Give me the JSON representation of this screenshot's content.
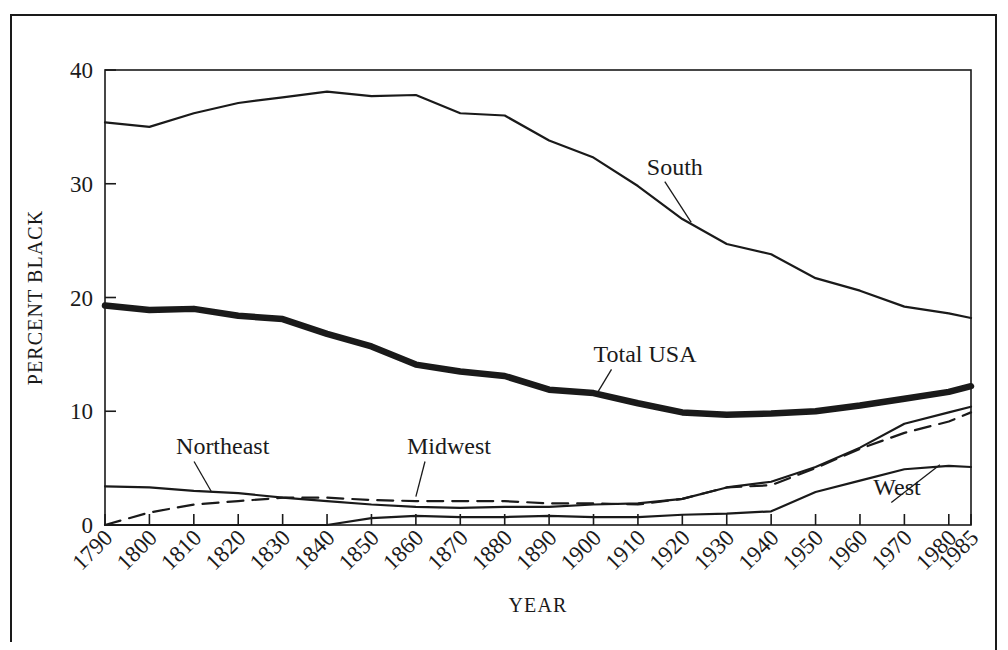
{
  "figure": {
    "kind": "line-chart",
    "background_color": "#ffffff",
    "ink_color": "#1a1a1a",
    "border": "thin rectangular rule around entire figure"
  },
  "chart_data": {
    "type": "line",
    "title": "",
    "subtitle": "",
    "xlabel": "YEAR",
    "ylabel": "PERCENT BLACK",
    "xlim": [
      1790,
      1985
    ],
    "ylim": [
      0,
      40
    ],
    "ytick_values": [
      0,
      10,
      20,
      30,
      40
    ],
    "ytick_labels": [
      "0",
      "10",
      "20",
      "30",
      "40"
    ],
    "x": [
      1790,
      1800,
      1810,
      1820,
      1830,
      1840,
      1850,
      1860,
      1870,
      1880,
      1890,
      1900,
      1910,
      1920,
      1930,
      1940,
      1950,
      1960,
      1970,
      1980,
      1985
    ],
    "xtick_labels": [
      "1790",
      "1800",
      "1810",
      "1820",
      "1830",
      "1840",
      "1850",
      "1860",
      "1870",
      "1880",
      "1890",
      "1900",
      "1910",
      "1920",
      "1930",
      "1940",
      "1950",
      "1960",
      "1970",
      "1980",
      "1985"
    ],
    "xtick_rotation_deg": 45,
    "grid": false,
    "legend": "inline labels with leader lines",
    "series": [
      {
        "name": "South",
        "style": "thin solid",
        "values": [
          35.4,
          35.0,
          36.2,
          37.1,
          37.6,
          38.1,
          37.7,
          37.8,
          36.2,
          36.0,
          33.8,
          32.3,
          29.8,
          26.9,
          24.7,
          23.8,
          21.7,
          20.6,
          19.2,
          18.6,
          18.2
        ]
      },
      {
        "name": "Total USA",
        "style": "thick solid",
        "values": [
          19.3,
          18.9,
          19.0,
          18.4,
          18.1,
          16.8,
          15.7,
          14.1,
          13.5,
          13.1,
          11.9,
          11.6,
          10.7,
          9.9,
          9.7,
          9.8,
          10.0,
          10.5,
          11.1,
          11.7,
          12.2
        ]
      },
      {
        "name": "Northeast",
        "style": "thin solid",
        "values": [
          3.4,
          3.3,
          3.0,
          2.8,
          2.4,
          2.1,
          1.8,
          1.6,
          1.5,
          1.6,
          1.6,
          1.8,
          1.9,
          2.3,
          3.3,
          3.8,
          5.1,
          6.8,
          8.9,
          9.9,
          10.4
        ]
      },
      {
        "name": "Midwest",
        "style": "dashed",
        "values": [
          0.0,
          1.1,
          1.8,
          2.1,
          2.4,
          2.4,
          2.2,
          2.1,
          2.1,
          2.1,
          1.9,
          1.9,
          1.8,
          2.3,
          3.3,
          3.5,
          5.0,
          6.7,
          8.1,
          9.1,
          9.9
        ]
      },
      {
        "name": "West",
        "style": "thin solid",
        "values": [
          0.0,
          0.0,
          0.0,
          0.0,
          0.0,
          0.0,
          0.6,
          0.8,
          0.7,
          0.7,
          0.8,
          0.7,
          0.7,
          0.9,
          1.0,
          1.2,
          2.9,
          3.9,
          4.9,
          5.2,
          5.1
        ]
      }
    ],
    "annotations": [
      {
        "text": "South",
        "series": "South",
        "label_x": 1912,
        "label_y": 30.8,
        "leader_to_x": 1922,
        "leader_to_y": 26.6
      },
      {
        "text": "Total USA",
        "series": "Total USA",
        "label_x": 1900,
        "label_y": 14.3,
        "leader_to_x": 1901,
        "leader_to_y": 11.7
      },
      {
        "text": "Northeast",
        "series": "Northeast",
        "label_x": 1806,
        "label_y": 6.2,
        "leader_to_x": 1814,
        "leader_to_y": 2.9
      },
      {
        "text": "Midwest",
        "series": "Midwest",
        "label_x": 1858,
        "label_y": 6.2,
        "leader_to_x": 1860,
        "leader_to_y": 2.5
      },
      {
        "text": "West",
        "series": "West",
        "label_x": 1963,
        "label_y": 2.6,
        "leader_to_x": 1978,
        "leader_to_y": 5.3
      }
    ]
  }
}
